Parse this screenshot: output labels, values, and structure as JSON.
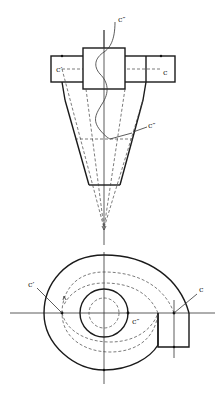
{
  "diagram": {
    "elevation_view": {
      "labels": {
        "c": "c",
        "c_prime": "c′",
        "c_double_top": "c″",
        "c_double_mid": "c″"
      }
    },
    "plan_view": {
      "labels": {
        "c": "c",
        "c_prime": "c′",
        "c_double": "c″"
      }
    },
    "colors": {
      "line": "#1a1a1a",
      "background": "#ffffff"
    }
  }
}
